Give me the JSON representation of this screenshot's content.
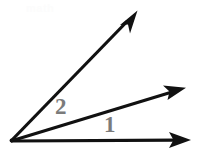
{
  "figure": {
    "kind": "angle-diagram",
    "width": 197,
    "height": 155,
    "background_color": "#ffffff",
    "stroke_color": "#111111",
    "label_color": "#7b7b7b",
    "watermark_color": "#fcfcfc",
    "vertex": {
      "x": 11,
      "y": 141
    },
    "rays": [
      {
        "name": "baseline-ray",
        "from": {
          "x": 11,
          "y": 141
        },
        "to": {
          "x": 190,
          "y": 140
        },
        "angle_degrees": 0,
        "arrowhead": true,
        "stroke_width": 3.2
      },
      {
        "name": "middle-ray",
        "from": {
          "x": 11,
          "y": 141
        },
        "to": {
          "x": 185,
          "y": 88
        },
        "angle_degrees": 17,
        "arrowhead": true,
        "stroke_width": 3.2
      },
      {
        "name": "upper-ray",
        "from": {
          "x": 11,
          "y": 141
        },
        "to": {
          "x": 137,
          "y": 11
        },
        "angle_degrees": 46,
        "arrowhead": true,
        "stroke_width": 3.2
      }
    ],
    "labels": [
      {
        "id": "angle-1",
        "text": "1",
        "x": 112,
        "y": 125,
        "between": [
          "baseline-ray",
          "middle-ray"
        ]
      },
      {
        "id": "angle-2",
        "text": "2",
        "x": 64,
        "y": 107,
        "between": [
          "middle-ray",
          "upper-ray"
        ]
      }
    ],
    "watermark": {
      "text": "math",
      "visible": true,
      "opacity": "very-low"
    }
  }
}
